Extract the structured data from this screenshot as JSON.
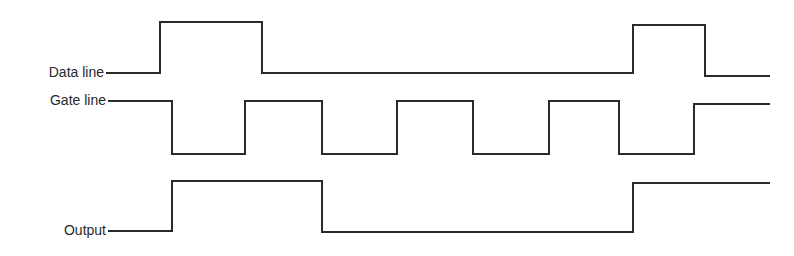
{
  "diagram": {
    "type": "timing-diagram",
    "signals": [
      {
        "name": "data",
        "label": "Data line",
        "points": [
          [
            106,
            73
          ],
          [
            160,
            73
          ],
          [
            160,
            22
          ],
          [
            262,
            22
          ],
          [
            262,
            73
          ],
          [
            633,
            73
          ],
          [
            633,
            25
          ],
          [
            705,
            25
          ],
          [
            705,
            76
          ],
          [
            770,
            76
          ]
        ]
      },
      {
        "name": "gate",
        "label": "Gate line",
        "points": [
          [
            108,
            101
          ],
          [
            172,
            101
          ],
          [
            172,
            154
          ],
          [
            245,
            154
          ],
          [
            245,
            101
          ],
          [
            322,
            101
          ],
          [
            322,
            154
          ],
          [
            397,
            154
          ],
          [
            397,
            101
          ],
          [
            473,
            101
          ],
          [
            473,
            154
          ],
          [
            549,
            154
          ],
          [
            549,
            101
          ],
          [
            619,
            101
          ],
          [
            619,
            154
          ],
          [
            694,
            154
          ],
          [
            694,
            104
          ],
          [
            770,
            104
          ]
        ]
      },
      {
        "name": "output",
        "label": "Output",
        "points": [
          [
            108,
            231
          ],
          [
            172,
            231
          ],
          [
            172,
            181
          ],
          [
            322,
            181
          ],
          [
            322,
            232
          ],
          [
            633,
            232
          ],
          [
            633,
            183
          ],
          [
            770,
            183
          ]
        ]
      }
    ],
    "stroke_color": "#2a2a2a"
  }
}
